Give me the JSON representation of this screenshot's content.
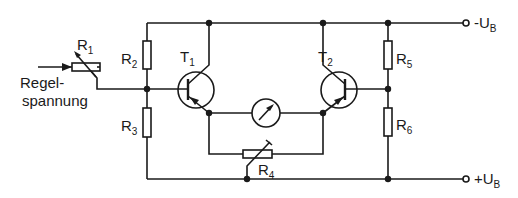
{
  "diagram": {
    "type": "circuit-schematic",
    "input_label": {
      "line1": "Regel-",
      "line2": "spannung"
    },
    "supply": {
      "top": {
        "sign": "-U",
        "sub": "B"
      },
      "bottom": {
        "sign": "+U",
        "sub": "B"
      }
    },
    "components": {
      "R1": {
        "letter": "R",
        "sub": "1",
        "kind": "variable-resistor"
      },
      "R2": {
        "letter": "R",
        "sub": "2",
        "kind": "resistor"
      },
      "R3": {
        "letter": "R",
        "sub": "3",
        "kind": "resistor"
      },
      "R4": {
        "letter": "R",
        "sub": "4",
        "kind": "potentiometer"
      },
      "R5": {
        "letter": "R",
        "sub": "5",
        "kind": "resistor"
      },
      "R6": {
        "letter": "R",
        "sub": "6",
        "kind": "resistor"
      },
      "T1": {
        "letter": "T",
        "sub": "1",
        "kind": "pnp-transistor"
      },
      "T2": {
        "letter": "T",
        "sub": "2",
        "kind": "pnp-transistor"
      },
      "M": {
        "kind": "meter"
      }
    },
    "colors": {
      "ink": "#1a1a1a",
      "background": "#ffffff"
    }
  }
}
